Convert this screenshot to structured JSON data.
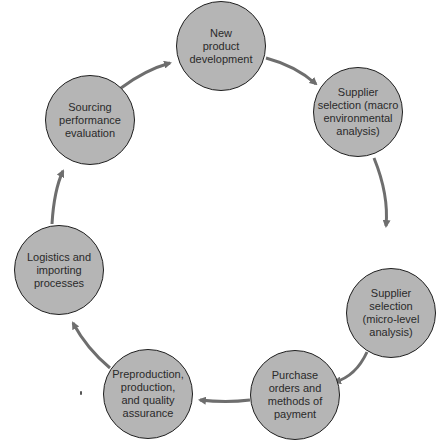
{
  "diagram": {
    "type": "cycle",
    "colors": {
      "node_fill": "#b5b5b5",
      "node_border": "#1f1f1f",
      "arrow": "#6e6e6e",
      "text": "#2a2a2a",
      "background": "#ffffff"
    },
    "nodes": [
      {
        "id": "n1",
        "label": "New\nproduct\ndevelopment"
      },
      {
        "id": "n2",
        "label": "Supplier\nselection (macro\nenvironmental\nanalysis)"
      },
      {
        "id": "n3",
        "label": "Supplier\nselection\n(micro-level\nanalysis)"
      },
      {
        "id": "n4",
        "label": "Purchase\norders and\nmethods of\npayment"
      },
      {
        "id": "n5",
        "label": "Preproduction,\nproduction,\nand quality\nassurance"
      },
      {
        "id": "n6",
        "label": "Logistics and\nimporting\nprocesses"
      },
      {
        "id": "n7",
        "label": "Sourcing\nperformance\nevaluation"
      }
    ],
    "edges": [
      {
        "from": "n1",
        "to": "n2"
      },
      {
        "from": "n2",
        "to": "n3"
      },
      {
        "from": "n3",
        "to": "n4"
      },
      {
        "from": "n4",
        "to": "n5"
      },
      {
        "from": "n5",
        "to": "n6"
      },
      {
        "from": "n6",
        "to": "n7"
      },
      {
        "from": "n7",
        "to": "n1"
      }
    ]
  }
}
